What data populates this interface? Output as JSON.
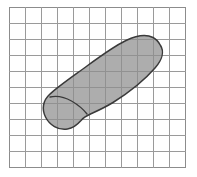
{
  "figure": {
    "background_color": "#ffffff",
    "width_px": 197,
    "height_px": 177
  },
  "grid": {
    "label": "measurement grid",
    "columns": 11,
    "rows": 10,
    "cell_width_px": 16.1,
    "cell_height_px": 16.1,
    "origin_x_px": 9,
    "origin_y_px": 7,
    "width_px": 177,
    "height_px": 161,
    "line_color": "#9a9a9a",
    "border_color": "#8c8c8c",
    "cell_fill_color": "#ffffff",
    "show_grid": true
  },
  "shape": {
    "label": "shoe sole outline",
    "kind": "footprint",
    "fill_color": "#8d8d8d",
    "fill_opacity": 0.72,
    "stroke_color": "#3a3a3a",
    "stroke_width": 1.5,
    "orientation": "diagonal, toe upper-right, heel lower-left",
    "sections": [
      {
        "name": "forefoot",
        "label": "forefoot and toe region"
      },
      {
        "name": "heel",
        "label": "heel region"
      }
    ],
    "divider": {
      "label": "arch divider line",
      "stroke_color": "#3a3a3a",
      "stroke_width": 1.3
    },
    "outline_path": "M 151.5 38.5 C 155.5 44.5 153.0 53.0 146.0 61.0 C 136.0 72.5 120.0 85.5 104.0 95.5 C 95.0 101.0 88.0 104.0 82.5 106.5 C 78.0 108.5 74.5 110.5 72.0 113.5 C 68.5 117.5 65.0 121.0 58.5 122.0 C 49.0 123.5 40.5 118.0 36.5 110.0 C 32.5 102.0 34.0 93.5 40.5 87.5 C 49.0 79.5 63.0 70.0 78.0 59.0 C 93.0 48.0 106.5 38.5 117.0 33.5 C 127.5 28.5 137.0 27.0 144.0 30.5 C 147.5 32.2 149.8 35.2 151.5 38.5 Z",
    "divider_path": "M 41.0 90.0 C 48.0 88.5 55.5 90.0 62.5 94.0 C 69.0 97.8 74.5 102.5 78.0 107.0"
  }
}
